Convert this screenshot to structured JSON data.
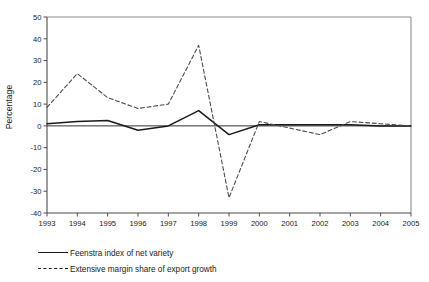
{
  "chart_data": {
    "type": "line",
    "title": "",
    "xlabel": "",
    "ylabel": "Percentage",
    "categories": [
      "1993",
      "1994",
      "1995",
      "1996",
      "1997",
      "1998",
      "1999",
      "2000",
      "2001",
      "2002",
      "2003",
      "2004",
      "2005"
    ],
    "x": [
      1993,
      1994,
      1995,
      1996,
      1997,
      1998,
      1999,
      2000,
      2001,
      2002,
      2003,
      2004,
      2005
    ],
    "ylim": [
      -40,
      50
    ],
    "xlim": [
      1993,
      2005
    ],
    "yticks": [
      -40,
      -30,
      -20,
      -10,
      0,
      10,
      20,
      30,
      40,
      50
    ],
    "ytick_labels": [
      "-40",
      "-30",
      "-20",
      "-10",
      "0",
      "10",
      "20",
      "30",
      "40",
      "50"
    ],
    "grid": false,
    "legend_position": "below-left",
    "series": [
      {
        "name": "Feenstra index of net variety",
        "style": "solid",
        "color": "#1a1a1a",
        "values": [
          1,
          2,
          2.5,
          -2,
          0,
          7,
          -4,
          0.5,
          0.5,
          0.5,
          0.5,
          0,
          0
        ]
      },
      {
        "name": "Extensive margin share of export growth",
        "style": "dashed",
        "color": "#4d4d4d",
        "values": [
          8.5,
          24,
          13,
          8,
          10,
          37,
          -33,
          2,
          -1,
          -4,
          2,
          1,
          0
        ]
      }
    ]
  },
  "legend": {
    "items": [
      {
        "label": "Feenstra index of net variety",
        "style": "solid"
      },
      {
        "label": "Extensive margin share of export growth",
        "style": "dashed"
      }
    ]
  },
  "axes": {
    "y_title": "Percentage"
  }
}
